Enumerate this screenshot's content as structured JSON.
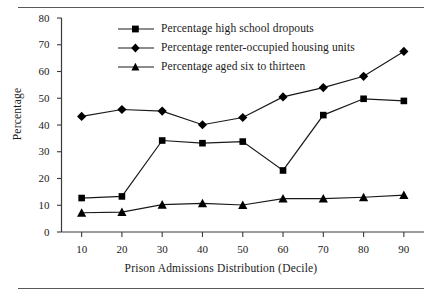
{
  "chart_data": {
    "type": "line",
    "title": "",
    "xlabel": "Prison Admissions Distribution (Decile)",
    "ylabel": "Percentage",
    "x": [
      10,
      20,
      30,
      40,
      50,
      60,
      70,
      80,
      90
    ],
    "xticklabels": [
      "10",
      "20",
      "30",
      "40",
      "50",
      "60",
      "70",
      "80",
      "90"
    ],
    "yticklabels": [
      "0",
      "10",
      "20",
      "30",
      "40",
      "50",
      "60",
      "70",
      "80"
    ],
    "yticks": [
      0,
      10,
      20,
      30,
      40,
      50,
      60,
      70,
      80
    ],
    "xlim": [
      5,
      95
    ],
    "ylim": [
      0,
      80
    ],
    "grid": false,
    "legend_position": "upper center",
    "series": [
      {
        "name": "Percentage high school dropouts",
        "marker": "square",
        "values": [
          12.7,
          13.3,
          34.2,
          33.2,
          33.8,
          23.0,
          43.7,
          49.8,
          49.0
        ]
      },
      {
        "name": "Percentage renter-occupied housing units",
        "marker": "diamond",
        "values": [
          43.2,
          45.8,
          45.2,
          40.1,
          42.8,
          50.5,
          54.0,
          58.2,
          67.5
        ]
      },
      {
        "name": "Percentage aged six to thirteen",
        "marker": "triangle",
        "values": [
          7.2,
          7.4,
          10.2,
          10.7,
          10.1,
          12.5,
          12.5,
          13.0,
          13.8
        ]
      }
    ],
    "colors": {
      "line": "#1a1a1a",
      "marker": "#000000",
      "axis": "#3a3a3a",
      "rule": "#59595c",
      "background": "#ffffff"
    }
  }
}
